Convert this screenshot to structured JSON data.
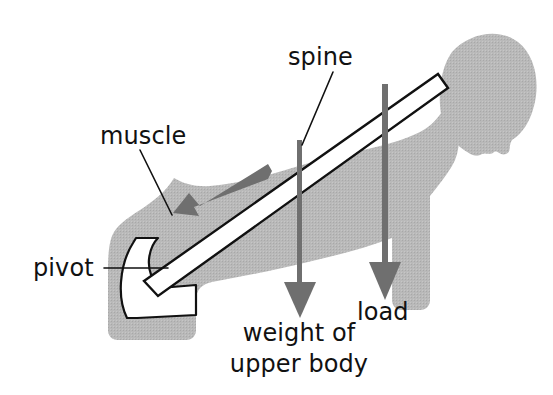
{
  "diagram": {
    "background_color": "#ffffff"
  },
  "colors": {
    "body_fill": "#b6b6b6",
    "arrow_gray": "#6f6f6f",
    "outline": "#111111",
    "bone_fill": "#ffffff",
    "text": "#111111"
  },
  "labels": {
    "spine": "spine",
    "muscle": "muscle",
    "pivot": "pivot",
    "load": "load",
    "weight_line1": "weight of",
    "weight_line2": "upper body"
  },
  "parts": {
    "spine_bar": "spine-lever-bar",
    "pivot_shape": "pelvis-pivot-shape",
    "muscle_arrow": "muscle-force-arrow",
    "weight_arrow": "weight-of-upper-body-arrow",
    "load_arrow": "load-arrow",
    "body_silhouette": "body-silhouette",
    "head": "head-silhouette"
  },
  "forces": [
    {
      "name": "muscle",
      "direction": "down-left along spine",
      "label": "muscle"
    },
    {
      "name": "weight of upper body",
      "direction": "down",
      "label": "weight of upper body"
    },
    {
      "name": "load",
      "direction": "down",
      "label": "load"
    }
  ]
}
